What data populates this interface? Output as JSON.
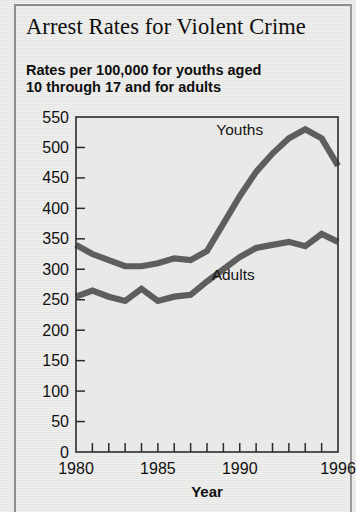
{
  "headline": "Arrest Rates for Violent Crime",
  "subtitle_line1": "Rates per 100,000 for youths aged",
  "subtitle_line2": "10 through 17 and for adults",
  "chart_data": {
    "type": "line",
    "title": "Arrest Rates for Violent Crime",
    "subtitle": "Rates per 100,000 for youths aged 10 through 17 and for adults",
    "xlabel": "Year",
    "ylabel": "",
    "xlim": [
      1980,
      1996
    ],
    "ylim": [
      0,
      550
    ],
    "ytick_step": 50,
    "yticks": [
      0,
      50,
      100,
      150,
      200,
      250,
      300,
      350,
      400,
      450,
      500,
      550
    ],
    "ytick_labels": [
      "0",
      "50",
      "100",
      "150",
      "200",
      "250",
      "300",
      "350",
      "400",
      "450",
      "500",
      "550"
    ],
    "x": [
      1980,
      1981,
      1982,
      1983,
      1984,
      1985,
      1986,
      1987,
      1988,
      1989,
      1990,
      1991,
      1992,
      1993,
      1994,
      1995,
      1996
    ],
    "xticks": [
      1980,
      1981,
      1982,
      1983,
      1984,
      1985,
      1986,
      1987,
      1988,
      1989,
      1990,
      1991,
      1992,
      1993,
      1994,
      1995,
      1996
    ],
    "xtick_labels": [
      "1980",
      "",
      "",
      "",
      "",
      "1985",
      "",
      "",
      "",
      "",
      "1990",
      "",
      "",
      "",
      "",
      "",
      "1996"
    ],
    "grid": false,
    "legend_position": "inline-annotation",
    "line_color": "#5e5e5e",
    "series": [
      {
        "name": "Youths",
        "values": [
          340,
          325,
          315,
          305,
          305,
          310,
          318,
          315,
          330,
          375,
          420,
          460,
          490,
          515,
          530,
          515,
          470
        ],
        "label_x": 1990,
        "label_y": 520
      },
      {
        "name": "Adults",
        "values": [
          255,
          265,
          255,
          248,
          268,
          248,
          255,
          258,
          280,
          300,
          320,
          335,
          340,
          345,
          338,
          358,
          345
        ],
        "label_x": 1989.6,
        "label_y": 283
      }
    ]
  }
}
